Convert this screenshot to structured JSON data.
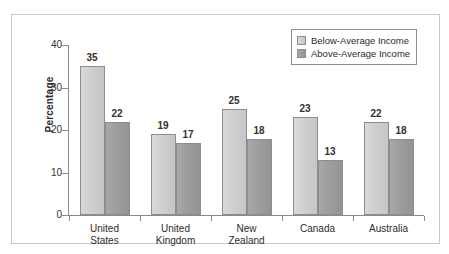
{
  "chart_data": {
    "type": "bar",
    "title": "",
    "xlabel": "",
    "ylabel": "Percentage",
    "ylim": [
      0,
      40
    ],
    "yticks": [
      0,
      10,
      20,
      30,
      40
    ],
    "ytick_labels": [
      "0",
      "10",
      "20",
      "30",
      "40"
    ],
    "grid": false,
    "legend_position": "top-right",
    "categories": [
      "United States",
      "United Kingdom",
      "New Zealand",
      "Canada",
      "Australia"
    ],
    "category_lines": [
      [
        "United",
        "States"
      ],
      [
        "United",
        "Kingdom"
      ],
      [
        "New",
        "Zealand"
      ],
      [
        "Canada"
      ],
      [
        "Australia"
      ]
    ],
    "series": [
      {
        "name": "Below-Average Income",
        "color": "#cfcfcf",
        "values": [
          35,
          19,
          25,
          23,
          22
        ]
      },
      {
        "name": "Above-Average Income",
        "color": "#9d9d9d",
        "values": [
          22,
          17,
          18,
          13,
          18
        ]
      }
    ],
    "value_labels": [
      [
        "35",
        "22"
      ],
      [
        "19",
        "17"
      ],
      [
        "25",
        "18"
      ],
      [
        "23",
        "13"
      ],
      [
        "22",
        "18"
      ]
    ]
  },
  "legend": {
    "items": [
      {
        "label": "Below-Average Income",
        "swatch": "light"
      },
      {
        "label": "Above-Average Income",
        "swatch": "dark"
      }
    ]
  },
  "axis": {
    "y_label": "Percentage",
    "y_ticks": [
      "40",
      "30",
      "20",
      "10",
      "0"
    ]
  }
}
